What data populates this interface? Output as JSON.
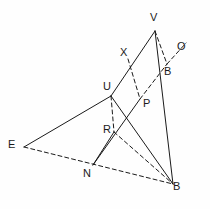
{
  "figure": {
    "type": "line-diagram",
    "background_color": "#fefefe",
    "stroke_color": "#1a1a1a",
    "width": 210,
    "height": 209
  },
  "points": {
    "V": {
      "label": "V",
      "x": 155,
      "y": 31,
      "label_x": 150,
      "label_y": 12
    },
    "X": {
      "label": "X",
      "x": 128,
      "y": 59,
      "label_x": 120,
      "label_y": 47
    },
    "O": {
      "label": "O",
      "x": 186,
      "y": 43,
      "label_x": 177,
      "label_y": 41
    },
    "B1": {
      "label": "B",
      "x": 167,
      "y": 64,
      "label_x": 164,
      "label_y": 66
    },
    "U": {
      "label": "U",
      "x": 111,
      "y": 96,
      "label_x": 103,
      "label_y": 81
    },
    "P": {
      "label": "P",
      "x": 140,
      "y": 99,
      "label_x": 143,
      "label_y": 98
    },
    "R": {
      "label": "R",
      "x": 114,
      "y": 132,
      "label_x": 103,
      "label_y": 124
    },
    "E": {
      "label": "E",
      "x": 24,
      "y": 147,
      "label_x": 8,
      "label_y": 139
    },
    "N": {
      "label": "N",
      "x": 93,
      "y": 165,
      "label_x": 83,
      "label_y": 168
    },
    "B2": {
      "label": "B",
      "x": 173,
      "y": 184,
      "label_x": 173,
      "label_y": 181
    }
  },
  "edges": [
    {
      "name": "edge-V-U",
      "from": "V",
      "to": "U",
      "style": "solid"
    },
    {
      "name": "edge-V-B1",
      "from": "V",
      "to": "B1",
      "style": "dashed"
    },
    {
      "name": "edge-B1-O",
      "from": "B1",
      "to": "O",
      "style": "dashed"
    },
    {
      "name": "edge-X-P",
      "from": "X",
      "to": "P",
      "style": "dashed"
    },
    {
      "name": "edge-P-B1",
      "from": "P",
      "to": "B1",
      "style": "dashed"
    },
    {
      "name": "edge-V-B2",
      "from": "V",
      "to": "B2",
      "style": "solid"
    },
    {
      "name": "edge-U-E",
      "from": "U",
      "to": "E",
      "style": "solid"
    },
    {
      "name": "edge-U-B2",
      "from": "U",
      "to": "B2",
      "style": "solid"
    },
    {
      "name": "edge-U-R",
      "from": "U",
      "to": "R",
      "style": "dashed"
    },
    {
      "name": "edge-P-N",
      "from": "P",
      "to": "N",
      "style": "solid"
    },
    {
      "name": "edge-R-N",
      "from": "R",
      "to": "N",
      "style": "solid"
    },
    {
      "name": "edge-R-B2",
      "from": "R",
      "to": "B2",
      "style": "dashed"
    },
    {
      "name": "edge-E-B2",
      "from": "E",
      "to": "B2",
      "style": "dashed"
    }
  ],
  "labels_order": [
    "V",
    "X",
    "O",
    "B1",
    "U",
    "P",
    "R",
    "E",
    "N",
    "B2"
  ]
}
